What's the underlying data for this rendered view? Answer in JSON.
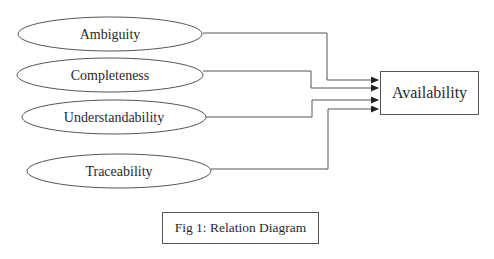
{
  "diagram": {
    "title": "Relation Diagram",
    "sources": [
      {
        "label": "Ambiguity"
      },
      {
        "label": "Completeness"
      },
      {
        "label": "Understandability"
      },
      {
        "label": "Traceability"
      }
    ],
    "target": {
      "label": "Availability"
    },
    "edges": [
      {
        "from": "Ambiguity",
        "to": "Availability"
      },
      {
        "from": "Completeness",
        "to": "Availability"
      },
      {
        "from": "Understandability",
        "to": "Availability"
      },
      {
        "from": "Traceability",
        "to": "Availability"
      }
    ]
  },
  "caption": {
    "text": "Fig 1: Relation Diagram"
  },
  "colors": {
    "stroke": "#555555",
    "text": "#2a2a2a",
    "background": "#ffffff"
  }
}
